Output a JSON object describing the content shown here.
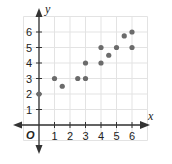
{
  "chart_data": {
    "type": "scatter",
    "title": "",
    "xlabel": "x",
    "ylabel": "y",
    "origin_label": "O",
    "xlim": [
      -1,
      7
    ],
    "ylim": [
      -1,
      7
    ],
    "x_ticks": [
      1,
      2,
      3,
      4,
      5,
      6
    ],
    "y_ticks": [
      1,
      2,
      3,
      4,
      5,
      6
    ],
    "grid": true,
    "legend": null,
    "series": [
      {
        "name": "points",
        "color": "#6b6b6b",
        "points": [
          {
            "x": 0,
            "y": 2
          },
          {
            "x": 1,
            "y": 3
          },
          {
            "x": 1.5,
            "y": 2.5
          },
          {
            "x": 2.5,
            "y": 3
          },
          {
            "x": 3,
            "y": 3
          },
          {
            "x": 3,
            "y": 4
          },
          {
            "x": 4,
            "y": 4
          },
          {
            "x": 4,
            "y": 5
          },
          {
            "x": 4.5,
            "y": 4.5
          },
          {
            "x": 5,
            "y": 5
          },
          {
            "x": 5.5,
            "y": 5.75
          },
          {
            "x": 6,
            "y": 6
          },
          {
            "x": 6,
            "y": 5
          }
        ]
      }
    ]
  },
  "colors": {
    "grid": "#e3e3e3",
    "axis": "#333333",
    "point": "#6b6b6b",
    "text": "#222222"
  }
}
